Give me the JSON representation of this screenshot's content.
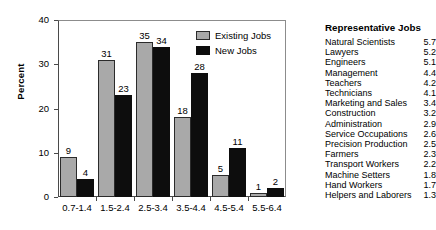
{
  "chart_data": {
    "type": "bar",
    "title": "",
    "xlabel": "",
    "ylabel": "Percent",
    "ylim": [
      0,
      40
    ],
    "yticks": [
      0,
      10,
      20,
      30,
      40
    ],
    "grid": false,
    "legend_position": "top-right",
    "categories": [
      "0.7-1.4",
      "1.5-2.4",
      "2.5-3.4",
      "3.5-4.4",
      "4.5-5.4",
      "5.5-6.4"
    ],
    "series": [
      {
        "name": "Existing Jobs",
        "color": "#a9a9a9",
        "values": [
          9,
          31,
          35,
          18,
          5,
          1
        ]
      },
      {
        "name": "New Jobs",
        "color": "#0d0d0d",
        "values": [
          4,
          23,
          34,
          28,
          11,
          2
        ]
      }
    ]
  },
  "legend": {
    "items": [
      {
        "label": "Existing Jobs"
      },
      {
        "label": "New Jobs"
      }
    ]
  },
  "jobs_panel": {
    "title": "Representative Jobs",
    "rows": [
      {
        "name": "Natural Scientists",
        "value": "5.7"
      },
      {
        "name": "Lawyers",
        "value": "5.2"
      },
      {
        "name": "Engineers",
        "value": "5.1"
      },
      {
        "name": "Management",
        "value": "4.4"
      },
      {
        "name": "Teachers",
        "value": "4.2"
      },
      {
        "name": "Technicians",
        "value": "4.1"
      },
      {
        "name": "Marketing and Sales",
        "value": "3.4"
      },
      {
        "name": "Construction",
        "value": "3.2"
      },
      {
        "name": "Administration",
        "value": "2.9"
      },
      {
        "name": "Service Occupations",
        "value": "2.6"
      },
      {
        "name": "Precision Production",
        "value": "2.5"
      },
      {
        "name": "Farmers",
        "value": "2.3"
      },
      {
        "name": "Transport Workers",
        "value": "2.2"
      },
      {
        "name": "Machine Setters",
        "value": "1.8"
      },
      {
        "name": "Hand Workers",
        "value": "1.7"
      },
      {
        "name": "Helpers and Laborers",
        "value": "1.3"
      }
    ]
  }
}
